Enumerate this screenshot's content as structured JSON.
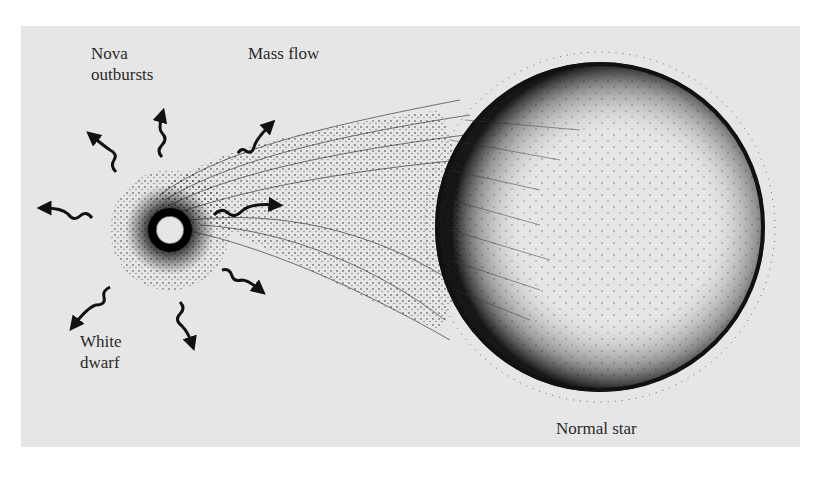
{
  "diagram": {
    "type": "binary-star-nova-system",
    "labels": {
      "nova_outbursts_line1": "Nova",
      "nova_outbursts_line2": "outbursts",
      "mass_flow": "Mass flow",
      "white_dwarf_line1": "White",
      "white_dwarf_line2": "dwarf",
      "normal_star": "Normal star"
    },
    "colors": {
      "background": "#e6e6e6",
      "ink": "#111111",
      "page": "#ffffff"
    },
    "components": [
      {
        "name": "white-dwarf",
        "center": [
          170,
          230
        ],
        "radius": 14
      },
      {
        "name": "normal-star",
        "center": [
          600,
          227
        ],
        "radius": 165
      },
      {
        "name": "mass-flow-stream",
        "from": "normal-star",
        "to": "white-dwarf"
      }
    ]
  }
}
